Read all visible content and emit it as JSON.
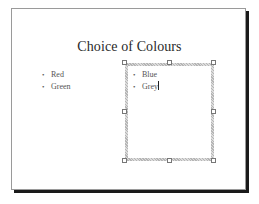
{
  "slide": {
    "title": "Choice of Colours",
    "left_placeholder": {
      "bullets": [
        "Red",
        "Green"
      ]
    },
    "right_placeholder": {
      "selected": true,
      "bullets": [
        "Blue",
        "Grey"
      ],
      "caret_after_item": 1
    }
  },
  "icons": {
    "bullet": "•"
  },
  "colors": {
    "slide_background": "#ffffff",
    "slide_border": "#9a9a9a",
    "slide_shadow": "#1a1a1a",
    "title_text": "#2a2a2a",
    "body_text": "#555555",
    "selection_border": "#b5b5b5"
  }
}
